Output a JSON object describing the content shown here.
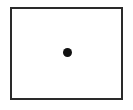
{
  "diagram": {
    "shapes": [
      {
        "type": "rectangle",
        "role": "frame",
        "stroke": "#2a2a2a",
        "fill": "#ffffff"
      },
      {
        "type": "circle",
        "role": "center-dot",
        "fill": "#111111"
      }
    ]
  }
}
